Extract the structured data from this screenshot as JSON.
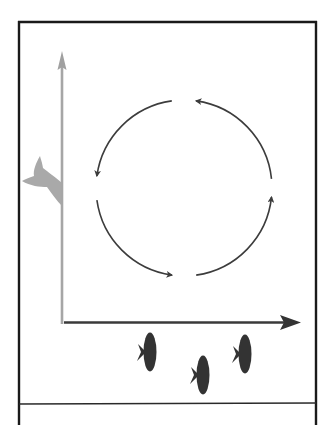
{
  "diagram": {
    "title": "",
    "colors": {
      "frame": "#1a1a1a",
      "vertical_axis": "#a6a6a6",
      "horizontal_axis": "#3a3a3a",
      "cycle_arrows": "#3c3c3c",
      "fish_tail": "#a9a9a9",
      "fish": "#333333",
      "background": "#ffffff"
    },
    "cycle": {
      "arrow_count": 4,
      "direction": "counter-clockwise"
    },
    "fish_count": 3,
    "labels": []
  }
}
